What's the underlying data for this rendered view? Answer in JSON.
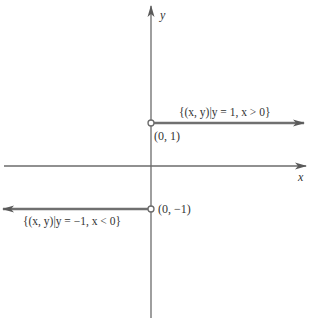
{
  "diagram": {
    "axes": {
      "x_label": "x",
      "y_label": "y"
    },
    "rays": [
      {
        "label": "{(x, y)|y = 1, x > 0}",
        "start_point_label": "(0, 1)",
        "start_point": [
          0,
          1
        ],
        "open_endpoint": true,
        "direction": "right"
      },
      {
        "label": "{(x, y)|y = −1, x < 0}",
        "start_point_label": "(0, −1)",
        "start_point": [
          0,
          -1
        ],
        "open_endpoint": true,
        "direction": "left"
      }
    ],
    "colors": {
      "axis": "#6b6b6b",
      "ray": "#707070",
      "text": "#333333"
    }
  }
}
